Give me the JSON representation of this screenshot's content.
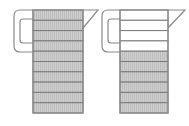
{
  "diagram": {
    "colors": {
      "filled": "#c8c8c8",
      "empty": "#ffffff",
      "outline": "#8a8a8a",
      "segment_line": "#7a7a7a"
    },
    "jugs": [
      {
        "id": "left",
        "segments": 10,
        "filled_segments": 10
      },
      {
        "id": "right",
        "segments": 10,
        "filled_segments": 6
      }
    ]
  }
}
